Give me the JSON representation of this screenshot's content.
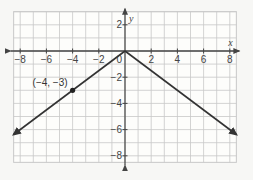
{
  "chart_data": {
    "type": "line",
    "title": "",
    "xlabel": "x",
    "ylabel": "y",
    "xlim": [
      -8.5,
      8.5
    ],
    "ylim": [
      -8.5,
      3
    ],
    "grid": true,
    "x_ticks": [
      -8,
      -6,
      -4,
      -2,
      2,
      4,
      6,
      8
    ],
    "y_ticks": [
      2,
      -2,
      -4,
      -6,
      -8
    ],
    "origin_label": "0",
    "series": [
      {
        "name": "y = -3/4 |x|",
        "points": [
          [
            -8.5,
            -6.375
          ],
          [
            0,
            0
          ],
          [
            8.5,
            -6.375
          ]
        ],
        "arrows": "both"
      }
    ],
    "annotations": [
      {
        "point": [
          -4,
          -3
        ],
        "label": "(−4, −3)"
      }
    ]
  },
  "colors": {
    "background": "#f7f7f5",
    "grid": "#c8c8c8",
    "axis": "#444444",
    "line": "#333333"
  }
}
